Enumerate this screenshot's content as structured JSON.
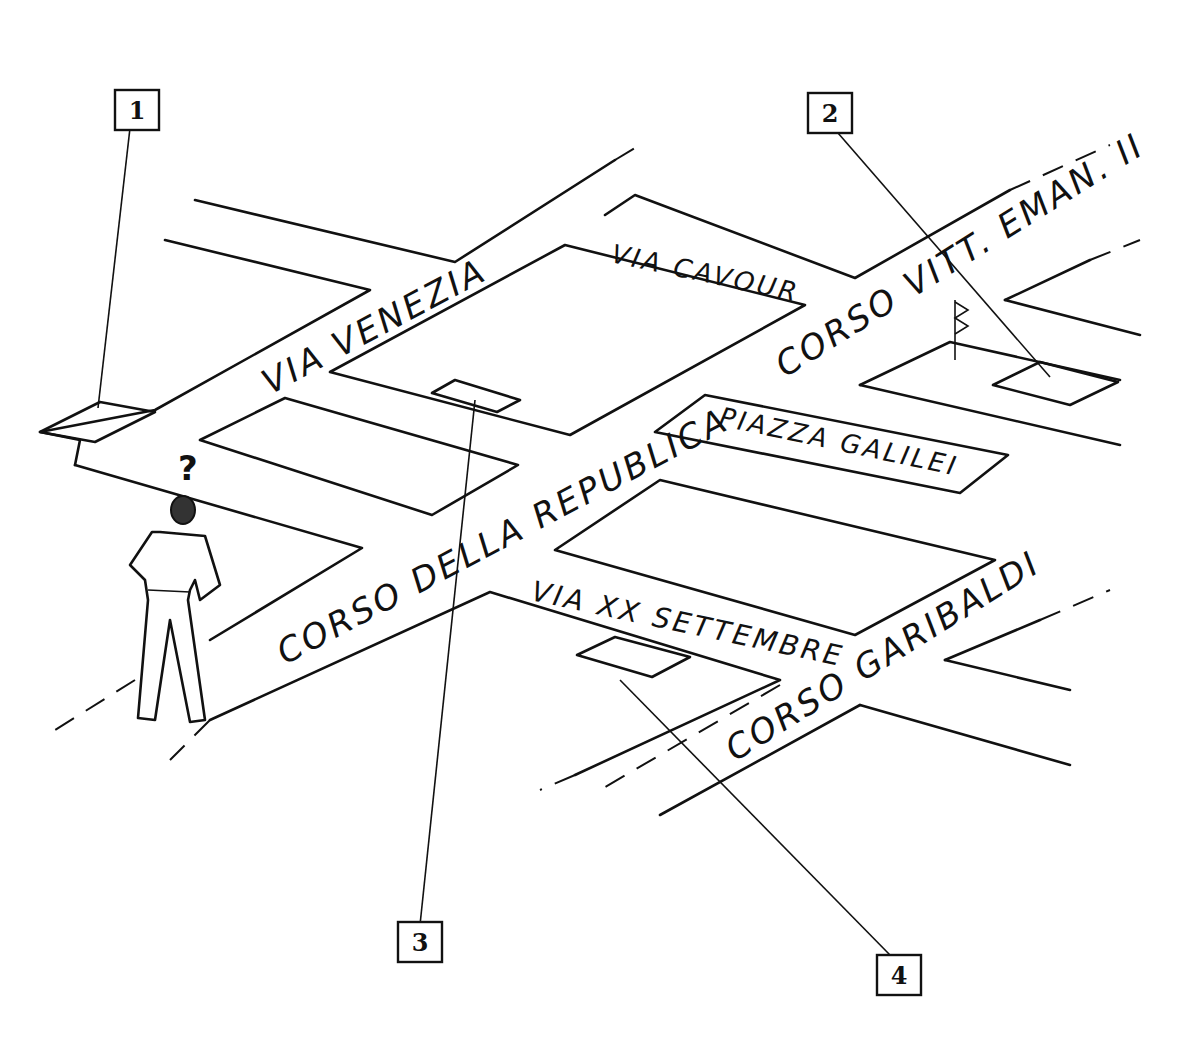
{
  "streets": {
    "via_venezia": "VIA VENEZIA",
    "via_cavour": "VIA CAVOUR",
    "corso_vitt_eman": "CORSO VITT. EMAN. II",
    "piazza_galilei": "PIAZZA GALILEI",
    "corso_della_repubblica": "CORSO DELLA REPUBLICA",
    "via_xx_settembre": "VIA XX SETTEMBRE",
    "corso_garibaldi": "CORSO GARIBALDI"
  },
  "callouts": [
    {
      "label": "1"
    },
    {
      "label": "2"
    },
    {
      "label": "3"
    },
    {
      "label": "4"
    }
  ],
  "figure": {
    "question_mark": "?"
  }
}
